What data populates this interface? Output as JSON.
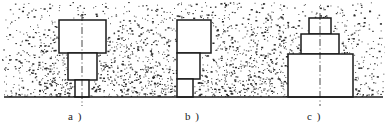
{
  "figure": {
    "width": 387,
    "height": 135,
    "background_color": "#ffffff",
    "ink_color": "#1a1a1a",
    "stipple_color": "#2b2b2b",
    "ground_line": {
      "name": "ground-line",
      "y": 97,
      "x_start": 4,
      "x_end": 383,
      "thickness": 1.6
    },
    "medium": {
      "name": "granular-stipple-fill",
      "top": 2,
      "bottom": 97,
      "left": 2,
      "right": 385,
      "density": "dense-random-dots"
    },
    "labels": [
      {
        "id": "a",
        "text": "a )",
        "x": 68,
        "y": 110
      },
      {
        "id": "b",
        "text": "b )",
        "x": 185,
        "y": 110
      },
      {
        "id": "c",
        "text": "c )",
        "x": 307,
        "y": 110
      }
    ],
    "parts": [
      {
        "id": "a",
        "name": "stepped-shaft-centered",
        "alignment": "center",
        "center_x": 82,
        "has_centerline": true,
        "centerline": {
          "x": 82,
          "y_top": 14,
          "y_bottom": 106,
          "style": "dash-dot"
        },
        "blocks": [
          {
            "name": "block-a-top",
            "x": 59,
            "y": 20,
            "width": 47,
            "height": 33
          },
          {
            "name": "block-a-middle",
            "x": 68,
            "y": 53,
            "width": 29,
            "height": 27
          },
          {
            "name": "block-a-bottom",
            "x": 75,
            "y": 80,
            "width": 14,
            "height": 17
          }
        ]
      },
      {
        "id": "b",
        "name": "stepped-shaft-left-aligned",
        "alignment": "left",
        "left_x": 177,
        "has_centerline": false,
        "blocks": [
          {
            "name": "block-b-top",
            "x": 177,
            "y": 20,
            "width": 34,
            "height": 33
          },
          {
            "name": "block-b-middle",
            "x": 177,
            "y": 53,
            "width": 23,
            "height": 26
          },
          {
            "name": "block-b-bottom",
            "x": 177,
            "y": 79,
            "width": 16,
            "height": 18
          }
        ]
      },
      {
        "id": "c",
        "name": "stepped-pyramid-centered",
        "alignment": "center",
        "center_x": 320,
        "has_centerline": true,
        "centerline": {
          "x": 320,
          "y_top": 13,
          "y_bottom": 106,
          "style": "dash-dot"
        },
        "blocks": [
          {
            "name": "block-c-top",
            "x": 309,
            "y": 18,
            "width": 22,
            "height": 16
          },
          {
            "name": "block-c-middle",
            "x": 301,
            "y": 34,
            "width": 38,
            "height": 20
          },
          {
            "name": "block-c-bottom",
            "x": 288,
            "y": 54,
            "width": 65,
            "height": 43
          }
        ]
      }
    ]
  }
}
